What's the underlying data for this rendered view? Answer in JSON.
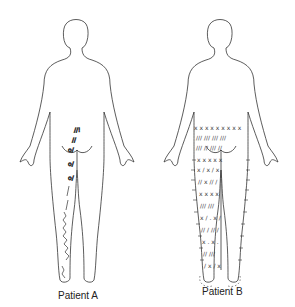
{
  "figure": {
    "panels": [
      {
        "label": "Patient A",
        "markings": "localized marks along lower back, buttock and one leg"
      },
      {
        "label": "Patient B",
        "markings": "widespread marks (x, /, o, ~) over lower back, buttocks, both legs and feet"
      }
    ]
  }
}
